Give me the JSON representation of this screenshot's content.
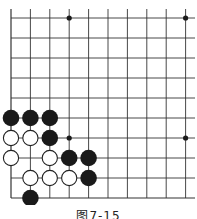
{
  "figure": {
    "caption": "图7-15",
    "type": "go-board-diagram",
    "grid": {
      "columns": 10,
      "rows": 10,
      "x0": 11,
      "y0": 18,
      "dx": 19.4,
      "dy": 20,
      "x_extent_right": 195,
      "y_extent_top": 9
    },
    "colors": {
      "line": "#333333",
      "black": "#1a1a1a",
      "white_fill": "#ffffff",
      "white_stroke": "#222222"
    },
    "star_points": [
      [
        3,
        0
      ],
      [
        9,
        0
      ],
      [
        3,
        6
      ],
      [
        9,
        6
      ]
    ],
    "stones": {
      "black": [
        [
          0,
          5
        ],
        [
          1,
          5
        ],
        [
          2,
          5
        ],
        [
          2,
          6
        ],
        [
          3,
          7
        ],
        [
          4,
          7
        ],
        [
          4,
          8
        ],
        [
          1,
          9
        ]
      ],
      "white": [
        [
          0,
          6
        ],
        [
          1,
          6
        ],
        [
          0,
          7
        ],
        [
          2,
          7
        ],
        [
          1,
          8
        ],
        [
          2,
          8
        ],
        [
          3,
          8
        ]
      ]
    }
  }
}
